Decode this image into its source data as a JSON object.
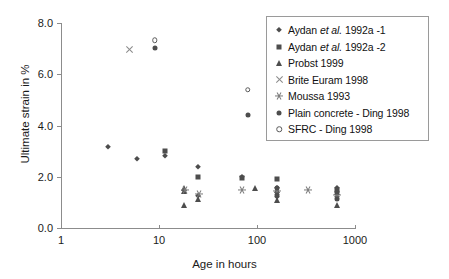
{
  "chart_data": {
    "type": "scatter",
    "title": "",
    "xlabel": "Age in hours",
    "ylabel": "Ultimate strain in %",
    "xscale": "log",
    "xlim": [
      1,
      1000
    ],
    "ylim": [
      0.0,
      8.0
    ],
    "xticks": [
      "1",
      "10",
      "100",
      "1000"
    ],
    "xtick_values": [
      1,
      10,
      100,
      1000
    ],
    "yticks": [
      "0.0",
      "2.0",
      "4.0",
      "6.0",
      "8.0"
    ],
    "ytick_values": [
      0.0,
      2.0,
      4.0,
      6.0,
      8.0
    ],
    "grid": false,
    "legend_position": "top-right",
    "series": [
      {
        "name": "Aydan et al. 1992a -1",
        "marker": "diamond",
        "color": "#4d4d4d",
        "points": [
          {
            "x": 3.0,
            "y": 3.17
          },
          {
            "x": 6.0,
            "y": 2.7
          },
          {
            "x": 11.5,
            "y": 2.8
          },
          {
            "x": 25.0,
            "y": 2.37
          },
          {
            "x": 25.0,
            "y": 1.24
          },
          {
            "x": 70.0,
            "y": 1.98
          },
          {
            "x": 160.0,
            "y": 1.55
          },
          {
            "x": 160.0,
            "y": 1.2
          },
          {
            "x": 660.0,
            "y": 1.55
          },
          {
            "x": 660.0,
            "y": 1.22
          }
        ]
      },
      {
        "name": "Aydan et al. 1992a -2",
        "marker": "square",
        "color": "#4d4d4d",
        "points": [
          {
            "x": 11.5,
            "y": 3.02
          },
          {
            "x": 25.0,
            "y": 2.0
          },
          {
            "x": 70.0,
            "y": 1.95
          },
          {
            "x": 160.0,
            "y": 1.92
          },
          {
            "x": 660.0,
            "y": 1.48
          }
        ]
      },
      {
        "name": "Probst 1999",
        "marker": "triangle",
        "color": "#4d4d4d",
        "points": [
          {
            "x": 18.0,
            "y": 1.58
          },
          {
            "x": 18.0,
            "y": 1.45
          },
          {
            "x": 18.0,
            "y": 0.88
          },
          {
            "x": 25.0,
            "y": 1.15
          },
          {
            "x": 95.0,
            "y": 1.58
          },
          {
            "x": 160.0,
            "y": 1.48
          },
          {
            "x": 160.0,
            "y": 1.08
          },
          {
            "x": 660.0,
            "y": 1.42
          },
          {
            "x": 660.0,
            "y": 0.9
          }
        ]
      },
      {
        "name": "Brite Euram 1998",
        "marker": "x",
        "color": "#8a8a8a",
        "points": [
          {
            "x": 5.0,
            "y": 6.97
          }
        ]
      },
      {
        "name": "Moussa 1993",
        "marker": "star",
        "color": "#7a7a7a",
        "points": [
          {
            "x": 18.5,
            "y": 1.5
          },
          {
            "x": 25.5,
            "y": 1.32
          },
          {
            "x": 70.0,
            "y": 1.48
          },
          {
            "x": 160.0,
            "y": 1.45
          },
          {
            "x": 330.0,
            "y": 1.48
          },
          {
            "x": 660.0,
            "y": 1.3
          }
        ]
      },
      {
        "name": "Plain concrete - Ding 1998",
        "marker": "circle",
        "color": "#4d4d4d",
        "points": [
          {
            "x": 9.0,
            "y": 7.02
          },
          {
            "x": 80.0,
            "y": 4.4
          },
          {
            "x": 160.0,
            "y": 1.55
          },
          {
            "x": 160.0,
            "y": 1.3
          },
          {
            "x": 660.0,
            "y": 1.4
          },
          {
            "x": 660.0,
            "y": 1.12
          }
        ]
      },
      {
        "name": "SFRC - Ding 1998",
        "marker": "open-circle",
        "color": "#5a5a5a",
        "points": [
          {
            "x": 9.0,
            "y": 7.33
          },
          {
            "x": 80.0,
            "y": 5.4
          }
        ]
      }
    ]
  },
  "legend": {
    "items": [
      {
        "label_pre": "Aydan ",
        "label_it": "et al.",
        "label_post": " 1992a -1",
        "marker": "diamond"
      },
      {
        "label_pre": "Aydan ",
        "label_it": "et al.",
        "label_post": " 1992a -2",
        "marker": "square"
      },
      {
        "label_pre": "Probst 1999",
        "label_it": "",
        "label_post": "",
        "marker": "triangle"
      },
      {
        "label_pre": "Brite Euram 1998",
        "label_it": "",
        "label_post": "",
        "marker": "x"
      },
      {
        "label_pre": "Moussa 1993",
        "label_it": "",
        "label_post": "",
        "marker": "star"
      },
      {
        "label_pre": "Plain concrete - Ding 1998",
        "label_it": "",
        "label_post": "",
        "marker": "circle"
      },
      {
        "label_pre": "SFRC - Ding 1998",
        "label_it": "",
        "label_post": "",
        "marker": "open-circle"
      }
    ]
  },
  "colors": {
    "axis": "#8c8c8c",
    "marker_dark": "#4d4d4d",
    "marker_gray": "#7a7a7a",
    "text": "#1a1a1a",
    "legend_border": "#9a9a9a",
    "background": "#ffffff"
  }
}
